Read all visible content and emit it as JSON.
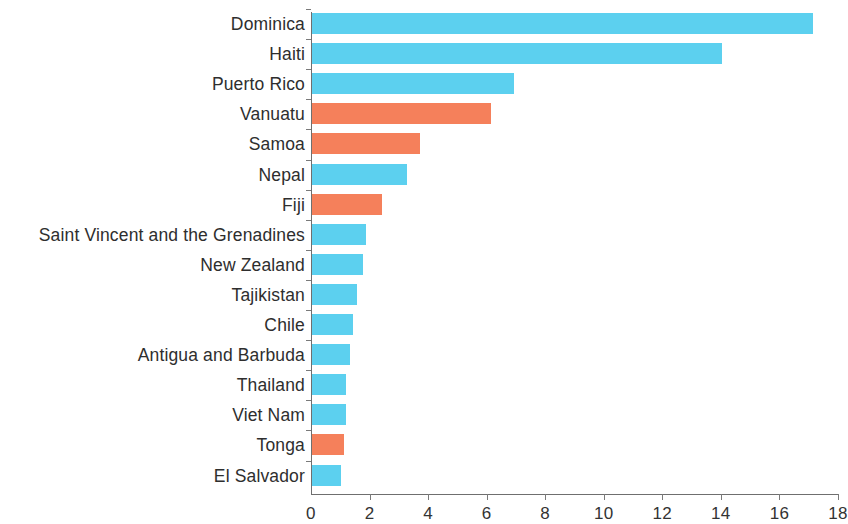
{
  "chart_data": {
    "type": "bar",
    "orientation": "horizontal",
    "title": "",
    "xlabel": "",
    "ylabel": "",
    "xlim": [
      0,
      18
    ],
    "xticks": [
      0,
      2,
      4,
      6,
      8,
      10,
      12,
      14,
      16,
      18
    ],
    "xtick_labels": [
      "0",
      "2",
      "4",
      "6",
      "8",
      "10",
      "12",
      "14",
      "16",
      "18"
    ],
    "grid": false,
    "legend": null,
    "colors": {
      "blue": "#5CD0EF",
      "orange": "#F5805B",
      "axis": "#6F6F6F",
      "text": "#2E2E2E",
      "background": "#FFFFFF"
    },
    "categories": [
      "Dominica",
      "Haiti",
      "Puerto Rico",
      "Vanuatu",
      "Samoa",
      "Nepal",
      "Fiji",
      "Saint Vincent and the Grenadines",
      "New Zealand",
      "Tajikistan",
      "Chile",
      "Antigua and Barbuda",
      "Thailand",
      "Viet Nam",
      "Tonga",
      "El Salvador"
    ],
    "values": [
      17.1,
      14.0,
      6.9,
      6.1,
      3.7,
      3.25,
      2.4,
      1.85,
      1.75,
      1.55,
      1.4,
      1.3,
      1.15,
      1.15,
      1.1,
      1.0
    ],
    "bar_colors": [
      "blue",
      "blue",
      "blue",
      "orange",
      "orange",
      "blue",
      "orange",
      "blue",
      "blue",
      "blue",
      "blue",
      "blue",
      "blue",
      "blue",
      "orange",
      "blue"
    ]
  }
}
